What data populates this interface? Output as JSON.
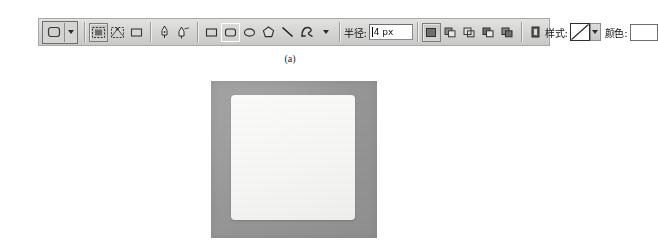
{
  "figure": {
    "caption": "(a)"
  },
  "options_bar": {
    "tool_preset": {
      "name": "rounded-rectangle-tool-preset",
      "icon": "rounded-rectangle-icon",
      "dropdown": "▼"
    },
    "draw_modes": [
      {
        "name": "shape-layers",
        "icon": "shape-layer-icon",
        "state": "pressed"
      },
      {
        "name": "paths",
        "icon": "paths-icon",
        "state": "normal"
      },
      {
        "name": "fill-pixels",
        "icon": "fill-pixels-icon",
        "state": "normal"
      }
    ],
    "pen_tools": [
      {
        "name": "pen-tool",
        "icon": "pen-icon"
      },
      {
        "name": "freeform-pen-tool",
        "icon": "freeform-pen-icon"
      }
    ],
    "shape_tools": [
      {
        "name": "rectangle-tool",
        "icon": "rectangle-icon",
        "state": "normal"
      },
      {
        "name": "rounded-rectangle-tool",
        "icon": "rounded-rectangle-icon",
        "state": "selected"
      },
      {
        "name": "ellipse-tool",
        "icon": "ellipse-icon",
        "state": "normal"
      },
      {
        "name": "polygon-tool",
        "icon": "polygon-icon",
        "state": "normal"
      },
      {
        "name": "line-tool",
        "icon": "line-icon",
        "state": "normal"
      },
      {
        "name": "custom-shape-tool",
        "icon": "custom-shape-icon",
        "state": "normal"
      }
    ],
    "shape_tools_dropdown": "▼",
    "radius": {
      "label": "半径:",
      "value": "4 px",
      "placeholder": "4 px"
    },
    "path_ops": [
      {
        "name": "add-to-shape-area",
        "icon": "add-shape-icon",
        "state": "pressed"
      },
      {
        "name": "subtract-from-shape-area",
        "icon": "subtract-shape-icon",
        "state": "normal"
      },
      {
        "name": "intersect-shape-areas",
        "icon": "intersect-shape-icon",
        "state": "normal"
      },
      {
        "name": "exclude-overlapping-areas",
        "icon": "exclude-shape-icon",
        "state": "normal"
      },
      {
        "name": "combine-shape-areas",
        "icon": "combine-shape-icon",
        "state": "normal"
      }
    ],
    "layer_style_toggle": {
      "name": "layer-style-icon",
      "icon": "layer-style-icon"
    },
    "style": {
      "label": "样式:",
      "value": "无样式",
      "swatch": "none-style-swatch",
      "dropdown": "▼"
    },
    "color": {
      "label": "颜色:",
      "value": "#ffffff"
    }
  },
  "artwork": {
    "name": "canvas-preview",
    "background_color": "#979797",
    "shape": {
      "name": "rounded-rectangle-shape",
      "fill_color": "#f7f7f5",
      "corner_radius_px": 4
    }
  }
}
